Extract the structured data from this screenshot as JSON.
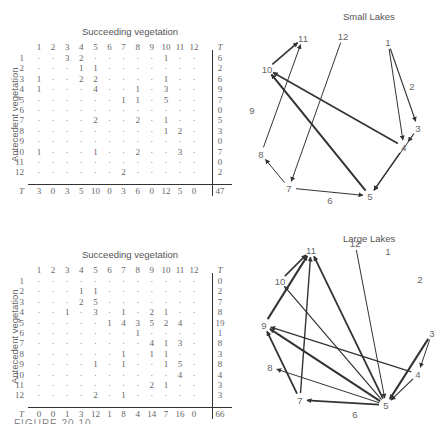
{
  "figure": {
    "caption_partial": "FIGURE 20.10"
  },
  "panels": [
    {
      "id": "small",
      "title": "Small Lakes",
      "table_title": "Succeeding vegetation",
      "ylabel": "Antecedent vegetation",
      "col_headers": [
        "1",
        "2",
        "3",
        "4",
        "5",
        "6",
        "7",
        "8",
        "9",
        "10",
        "11",
        "12"
      ],
      "total_label": "T",
      "rows": [
        {
          "label": "1",
          "cells": [
            "·",
            "·",
            "3",
            "2",
            "·",
            "·",
            "·",
            "·",
            "·",
            "1",
            "·",
            "·"
          ],
          "total": "6"
        },
        {
          "label": "2",
          "cells": [
            "·",
            "·",
            "·",
            "1",
            "1",
            "·",
            "·",
            "·",
            "·",
            "·",
            "·",
            "·"
          ],
          "total": "2"
        },
        {
          "label": "3",
          "cells": [
            "1",
            "·",
            "·",
            "2",
            "2",
            "·",
            "·",
            "·",
            "·",
            "1",
            "·",
            "·"
          ],
          "total": "6"
        },
        {
          "label": "4",
          "cells": [
            "1",
            "·",
            "·",
            "·",
            "4",
            "·",
            "·",
            "1",
            "·",
            "3",
            "·",
            "·"
          ],
          "total": "9"
        },
        {
          "label": "5",
          "cells": [
            "·",
            "·",
            "·",
            "·",
            "·",
            "·",
            "1",
            "1",
            "·",
            "5",
            "·",
            "·"
          ],
          "total": "7"
        },
        {
          "label": "6",
          "cells": [
            "·",
            "·",
            "·",
            "·",
            "·",
            "·",
            "·",
            "·",
            "·",
            "·",
            "·",
            "·"
          ],
          "total": "0"
        },
        {
          "label": "7",
          "cells": [
            "·",
            "·",
            "·",
            "·",
            "2",
            "·",
            "·",
            "2",
            "·",
            "1",
            "·",
            "·"
          ],
          "total": "5"
        },
        {
          "label": "8",
          "cells": [
            "·",
            "·",
            "·",
            "·",
            "·",
            "·",
            "·",
            "·",
            "·",
            "1",
            "2",
            "·"
          ],
          "total": "3"
        },
        {
          "label": "9",
          "cells": [
            "·",
            "·",
            "·",
            "·",
            "·",
            "·",
            "·",
            "·",
            "·",
            "·",
            "·",
            "·"
          ],
          "total": "0"
        },
        {
          "label": "10",
          "cells": [
            "1",
            "·",
            "·",
            "·",
            "1",
            "·",
            "·",
            "2",
            "·",
            "·",
            "3",
            "·"
          ],
          "total": "7"
        },
        {
          "label": "11",
          "cells": [
            "·",
            "·",
            "·",
            "·",
            "·",
            "·",
            "·",
            "·",
            "·",
            "·",
            "·",
            "·"
          ],
          "total": "0"
        },
        {
          "label": "12",
          "cells": [
            "·",
            "·",
            "·",
            "·",
            "·",
            "·",
            "2",
            "·",
            "·",
            "·",
            "·",
            "·"
          ],
          "total": "2"
        }
      ],
      "col_totals": [
        "3",
        "0",
        "3",
        "5",
        "10",
        "0",
        "3",
        "6",
        "0",
        "12",
        "5",
        "0"
      ],
      "grand_total": "47",
      "nodes": [
        {
          "id": "1",
          "x": 388,
          "y": 42
        },
        {
          "id": "2",
          "x": 412,
          "y": 86
        },
        {
          "id": "3",
          "x": 418,
          "y": 128
        },
        {
          "id": "4",
          "x": 404,
          "y": 147
        },
        {
          "id": "5",
          "x": 370,
          "y": 196
        },
        {
          "id": "6",
          "x": 330,
          "y": 200
        },
        {
          "id": "7",
          "x": 289,
          "y": 188
        },
        {
          "id": "8",
          "x": 261,
          "y": 154
        },
        {
          "id": "9",
          "x": 252,
          "y": 110
        },
        {
          "id": "10",
          "x": 267,
          "y": 69
        },
        {
          "id": "11",
          "x": 303,
          "y": 38
        },
        {
          "id": "12",
          "x": 343,
          "y": 36
        }
      ],
      "edges": [
        {
          "from": "1",
          "to": "3",
          "w": 1.2
        },
        {
          "from": "1",
          "to": "4",
          "w": 1.0
        },
        {
          "from": "3",
          "to": "4",
          "w": 1.0
        },
        {
          "from": "3",
          "to": "5",
          "w": 1.0
        },
        {
          "from": "4",
          "to": "5",
          "w": 1.4
        },
        {
          "from": "4",
          "to": "10",
          "w": 1.6
        },
        {
          "from": "5",
          "to": "10",
          "w": 2.0
        },
        {
          "from": "7",
          "to": "5",
          "w": 1.0
        },
        {
          "from": "7",
          "to": "8",
          "w": 1.0
        },
        {
          "from": "8",
          "to": "11",
          "w": 1.0
        },
        {
          "from": "10",
          "to": "11",
          "w": 1.6
        },
        {
          "from": "12",
          "to": "7",
          "w": 1.0
        }
      ]
    },
    {
      "id": "large",
      "title": "Large Lakes",
      "table_title": "Succeeding vegetation",
      "ylabel": "Antecedent vegetation",
      "col_headers": [
        "1",
        "2",
        "3",
        "4",
        "5",
        "6",
        "7",
        "8",
        "9",
        "10",
        "11",
        "12"
      ],
      "total_label": "T",
      "rows": [
        {
          "label": "1",
          "cells": [
            "·",
            "·",
            "·",
            "·",
            "·",
            "·",
            "·",
            "·",
            "·",
            "·",
            "·",
            "·"
          ],
          "total": "0"
        },
        {
          "label": "2",
          "cells": [
            "·",
            "·",
            "·",
            "1",
            "1",
            "·",
            "·",
            "·",
            "·",
            "·",
            "·",
            "·"
          ],
          "total": "2"
        },
        {
          "label": "3",
          "cells": [
            "·",
            "·",
            "·",
            "2",
            "5",
            "·",
            "·",
            "·",
            "·",
            "·",
            "·",
            "·"
          ],
          "total": "7"
        },
        {
          "label": "4",
          "cells": [
            "·",
            "·",
            "1",
            "·",
            "3",
            "·",
            "1",
            "·",
            "2",
            "1",
            "·",
            "·"
          ],
          "total": "8"
        },
        {
          "label": "5",
          "cells": [
            "·",
            "·",
            "·",
            "·",
            "·",
            "1",
            "4",
            "3",
            "5",
            "2",
            "4",
            "·"
          ],
          "total": "19"
        },
        {
          "label": "6",
          "cells": [
            "·",
            "·",
            "·",
            "·",
            "·",
            "·",
            "·",
            "1",
            "·",
            "·",
            "·",
            "·"
          ],
          "total": "1"
        },
        {
          "label": "7",
          "cells": [
            "·",
            "·",
            "·",
            "·",
            "·",
            "·",
            "·",
            "·",
            "4",
            "1",
            "3",
            "·"
          ],
          "total": "8"
        },
        {
          "label": "8",
          "cells": [
            "·",
            "·",
            "·",
            "·",
            "·",
            "·",
            "1",
            "·",
            "1",
            "1",
            "·",
            "·"
          ],
          "total": "3"
        },
        {
          "label": "9",
          "cells": [
            "·",
            "·",
            "·",
            "·",
            "1",
            "·",
            "1",
            "·",
            "·",
            "1",
            "5",
            "·"
          ],
          "total": "8"
        },
        {
          "label": "10",
          "cells": [
            "·",
            "·",
            "·",
            "·",
            "·",
            "·",
            "·",
            "·",
            "·",
            "·",
            "4",
            "·"
          ],
          "total": "4"
        },
        {
          "label": "11",
          "cells": [
            "·",
            "·",
            "·",
            "·",
            "·",
            "·",
            "·",
            "·",
            "2",
            "1",
            "·",
            "·"
          ],
          "total": "3"
        },
        {
          "label": "12",
          "cells": [
            "·",
            "·",
            "·",
            "·",
            "2",
            "·",
            "1",
            "·",
            "·",
            "·",
            "·",
            "·"
          ],
          "total": "3"
        }
      ],
      "col_totals": [
        "0",
        "0",
        "1",
        "3",
        "12",
        "1",
        "8",
        "4",
        "14",
        "7",
        "16",
        "0"
      ],
      "grand_total": "66",
      "nodes": [
        {
          "id": "1",
          "x": 388,
          "y": 251
        },
        {
          "id": "2",
          "x": 420,
          "y": 279
        },
        {
          "id": "3",
          "x": 432,
          "y": 333
        },
        {
          "id": "4",
          "x": 418,
          "y": 374
        },
        {
          "id": "5",
          "x": 386,
          "y": 405
        },
        {
          "id": "6",
          "x": 355,
          "y": 414
        },
        {
          "id": "7",
          "x": 300,
          "y": 400
        },
        {
          "id": "8",
          "x": 270,
          "y": 367
        },
        {
          "id": "9",
          "x": 264,
          "y": 325
        },
        {
          "id": "10",
          "x": 280,
          "y": 281
        },
        {
          "id": "11",
          "x": 311,
          "y": 250
        },
        {
          "id": "12",
          "x": 355,
          "y": 243
        }
      ],
      "edges": [
        {
          "from": "3",
          "to": "4",
          "w": 1.0
        },
        {
          "from": "3",
          "to": "5",
          "w": 2.0
        },
        {
          "from": "4",
          "to": "5",
          "w": 1.2
        },
        {
          "from": "4",
          "to": "9",
          "w": 1.2
        },
        {
          "from": "5",
          "to": "7",
          "w": 1.8
        },
        {
          "from": "5",
          "to": "9",
          "w": 2.0
        },
        {
          "from": "5",
          "to": "11",
          "w": 1.8
        },
        {
          "from": "5",
          "to": "10",
          "w": 1.2
        },
        {
          "from": "5",
          "to": "8",
          "w": 1.0
        },
        {
          "from": "7",
          "to": "9",
          "w": 1.8
        },
        {
          "from": "7",
          "to": "11",
          "w": 1.4
        },
        {
          "from": "9",
          "to": "11",
          "w": 2.0
        },
        {
          "from": "10",
          "to": "11",
          "w": 1.6
        },
        {
          "from": "12",
          "to": "5",
          "w": 1.0
        }
      ]
    }
  ]
}
